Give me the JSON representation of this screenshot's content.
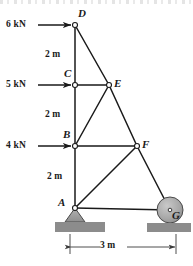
{
  "figure": {
    "type": "truss-free-body-diagram",
    "background_color": "#ffffff",
    "line_color": "#1a1a1a",
    "support_fill": "#9a9a9a",
    "ground_fill": "#8c8c8c",
    "node_fill": "#ffffff"
  },
  "nodes": [
    {
      "id": "D",
      "label": "D",
      "x": 75,
      "y": 25,
      "label_x": 78,
      "label_y": 8,
      "joint": true
    },
    {
      "id": "C",
      "label": "C",
      "x": 75,
      "y": 85,
      "label_x": 64,
      "label_y": 68,
      "joint": true
    },
    {
      "id": "E",
      "label": "E",
      "x": 109,
      "y": 85,
      "label_x": 114,
      "label_y": 78,
      "joint": true
    },
    {
      "id": "B",
      "label": "B",
      "x": 75,
      "y": 146,
      "label_x": 63,
      "label_y": 129,
      "joint": true
    },
    {
      "id": "F",
      "label": "F",
      "x": 137,
      "y": 146,
      "label_x": 142,
      "label_y": 139,
      "joint": true
    },
    {
      "id": "A",
      "label": "A",
      "x": 75,
      "y": 208,
      "label_x": 58,
      "label_y": 197,
      "joint": true
    },
    {
      "id": "G",
      "label": "G",
      "x": 170,
      "y": 210,
      "label_x": 172,
      "label_y": 210,
      "joint": true
    }
  ],
  "members": [
    {
      "from": "D",
      "to": "C"
    },
    {
      "from": "C",
      "to": "B"
    },
    {
      "from": "B",
      "to": "A"
    },
    {
      "from": "D",
      "to": "E"
    },
    {
      "from": "C",
      "to": "E"
    },
    {
      "from": "B",
      "to": "E"
    },
    {
      "from": "E",
      "to": "F"
    },
    {
      "from": "B",
      "to": "F"
    },
    {
      "from": "A",
      "to": "F"
    },
    {
      "from": "F",
      "to": "G"
    },
    {
      "from": "A",
      "to": "G"
    }
  ],
  "loads": [
    {
      "id": "load-d",
      "label": "6 kN",
      "magnitude": 6,
      "unit": "kN",
      "at_node": "D",
      "direction": "right",
      "tail_x": 38,
      "tip_x": 73,
      "y": 25,
      "label_x": 6,
      "label_y": 20
    },
    {
      "id": "load-c",
      "label": "5 kN",
      "magnitude": 5,
      "unit": "kN",
      "at_node": "C",
      "direction": "right",
      "tail_x": 38,
      "tip_x": 73,
      "y": 85,
      "label_x": 6,
      "label_y": 80
    },
    {
      "id": "load-b",
      "label": "4 kN",
      "magnitude": 4,
      "unit": "kN",
      "at_node": "B",
      "direction": "right",
      "tail_x": 38,
      "tip_x": 73,
      "y": 146,
      "label_x": 6,
      "label_y": 141
    }
  ],
  "dimensions": {
    "vertical": [
      {
        "id": "dim-dc",
        "label": "2 m",
        "value": 2,
        "unit": "m",
        "between": "D-C",
        "label_x": 45,
        "label_y": 50
      },
      {
        "id": "dim-cb",
        "label": "2 m",
        "value": 2,
        "unit": "m",
        "between": "C-B",
        "label_x": 45,
        "label_y": 110
      },
      {
        "id": "dim-ba",
        "label": "2 m",
        "value": 2,
        "unit": "m",
        "between": "B-A",
        "label_x": 47,
        "label_y": 172
      }
    ],
    "horizontal": [
      {
        "id": "dim-span",
        "label": "3 m",
        "value": 3,
        "unit": "m",
        "between": "A-G",
        "x1": 70,
        "x2": 176,
        "y": 247,
        "label_x": 110,
        "label_y": 242
      }
    ]
  },
  "supports": [
    {
      "id": "support-a",
      "kind": "pin",
      "at_node": "A",
      "x": 75,
      "y": 208
    },
    {
      "id": "support-g",
      "kind": "roller",
      "at_node": "G",
      "x": 170,
      "y": 210,
      "radius": 13
    }
  ],
  "ground_blocks": [
    {
      "id": "ground-left",
      "x": 55,
      "y": 222,
      "width": 50,
      "height": 10
    },
    {
      "id": "ground-right",
      "x": 147,
      "y": 223,
      "width": 44,
      "height": 9
    }
  ]
}
